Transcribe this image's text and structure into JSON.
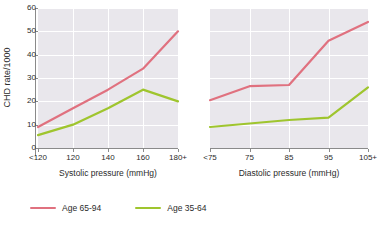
{
  "chart_data": {
    "type": "line",
    "title": "",
    "ylabel": "CHD rate/1000",
    "ylim": [
      0,
      60
    ],
    "yticks": [
      0,
      10,
      20,
      30,
      40,
      50,
      60
    ],
    "grid": true,
    "legend_position": "bottom-left",
    "legend": [
      {
        "name": "Age 65-94",
        "color": "#e0717f"
      },
      {
        "name": "Age 35-64",
        "color": "#9fc52e"
      }
    ],
    "panels": [
      {
        "id": "systolic",
        "xlabel": "Systolic pressure (mmHg)",
        "categories": [
          "<120",
          "120",
          "140",
          "160",
          "180+"
        ],
        "series": [
          {
            "name": "Age 65-94",
            "color": "#e0717f",
            "values": [
              9,
              17,
              25,
              34,
              50
            ]
          },
          {
            "name": "Age 35-64",
            "color": "#9fc52e",
            "values": [
              5.5,
              10,
              17,
              25,
              20
            ]
          }
        ]
      },
      {
        "id": "diastolic",
        "xlabel": "Diastolic pressure (mmHg)",
        "categories": [
          "<75",
          "75",
          "85",
          "95",
          "105+"
        ],
        "series": [
          {
            "name": "Age 65-94",
            "color": "#e0717f",
            "values": [
              20.5,
              26.5,
              27,
              46,
              54
            ]
          },
          {
            "name": "Age 35-64",
            "color": "#9fc52e",
            "values": [
              9,
              10.5,
              12,
              13,
              26
            ]
          }
        ]
      }
    ]
  },
  "colors": {
    "plot_background": "#e9e7ec",
    "gridline": "#ffffff",
    "axis": "#8a8a8a",
    "text": "#2b2b2b",
    "series_old": "#e0717f",
    "series_young": "#9fc52e"
  }
}
